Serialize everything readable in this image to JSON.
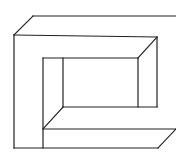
{
  "figure": {
    "stroke_color": "#222222",
    "background": "#ffffff",
    "lines": [
      {
        "id": "outer-top-back",
        "x1": 33,
        "y1": 16,
        "x2": 176,
        "y2": 16
      },
      {
        "id": "outer-top-left-diagonal",
        "x1": 14,
        "y1": 35,
        "x2": 33,
        "y2": 16
      },
      {
        "id": "outer-front-top",
        "x1": 14,
        "y1": 35,
        "x2": 157,
        "y2": 37
      },
      {
        "id": "outer-left",
        "x1": 14,
        "y1": 35,
        "x2": 14,
        "y2": 148
      },
      {
        "id": "outer-bottom",
        "x1": 14,
        "y1": 148,
        "x2": 158,
        "y2": 148
      },
      {
        "id": "right-top-diagonal",
        "x1": 157,
        "y1": 37,
        "x2": 138,
        "y2": 58
      },
      {
        "id": "right-back-vertical",
        "x1": 157,
        "y1": 37,
        "x2": 157,
        "y2": 107
      },
      {
        "id": "inner-top",
        "x1": 43,
        "y1": 58,
        "x2": 138,
        "y2": 58
      },
      {
        "id": "inner-left",
        "x1": 43,
        "y1": 58,
        "x2": 43,
        "y2": 148
      },
      {
        "id": "inner-back-left",
        "x1": 63,
        "y1": 58,
        "x2": 63,
        "y2": 107
      },
      {
        "id": "inner-right",
        "x1": 138,
        "y1": 58,
        "x2": 138,
        "y2": 107
      },
      {
        "id": "inner-bottom",
        "x1": 63,
        "y1": 107,
        "x2": 157,
        "y2": 107
      },
      {
        "id": "inner-bottom-diagonal",
        "x1": 63,
        "y1": 107,
        "x2": 43,
        "y2": 129
      },
      {
        "id": "slab-top",
        "x1": 43,
        "y1": 129,
        "x2": 176,
        "y2": 129
      },
      {
        "id": "slab-right-diagonal",
        "x1": 176,
        "y1": 129,
        "x2": 158,
        "y2": 148
      }
    ]
  }
}
